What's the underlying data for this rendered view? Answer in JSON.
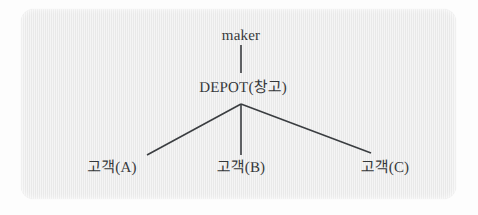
{
  "diagram": {
    "type": "tree",
    "title": "",
    "panel": {
      "background_color": "#e9e9e9",
      "page_background_color": "#fdfdfd"
    },
    "line_color": "#3a3d40",
    "text_color": "#35383a",
    "nodes": [
      {
        "id": "maker",
        "label": "maker",
        "level": 0,
        "x": 241,
        "y": 36,
        "script": "latin"
      },
      {
        "id": "depot",
        "label": "DEPOT(창고)",
        "level": 1,
        "x": 243,
        "y": 86,
        "script": "mixed"
      },
      {
        "id": "customer_a",
        "label": "고객(A)",
        "level": 2,
        "x": 112,
        "y": 166,
        "script": "korean"
      },
      {
        "id": "customer_b",
        "label": "고객(B)",
        "level": 2,
        "x": 241,
        "y": 166,
        "script": "korean"
      },
      {
        "id": "customer_c",
        "label": "고객(C)",
        "level": 2,
        "x": 385,
        "y": 166,
        "script": "korean"
      }
    ],
    "edges": [
      {
        "id": "edge-maker-depot",
        "from": "maker",
        "to": "depot",
        "x1": 241,
        "y1": 45,
        "x2": 241,
        "y2": 73
      },
      {
        "id": "edge-depot-customer-a",
        "from": "depot",
        "to": "customer_a",
        "x1": 241,
        "y1": 104,
        "x2": 147,
        "y2": 155
      },
      {
        "id": "edge-depot-customer-b",
        "from": "depot",
        "to": "customer_b",
        "x1": 241,
        "y1": 104,
        "x2": 241,
        "y2": 155
      },
      {
        "id": "edge-depot-customer-c",
        "from": "depot",
        "to": "customer_c",
        "x1": 241,
        "y1": 104,
        "x2": 371,
        "y2": 153
      }
    ]
  }
}
